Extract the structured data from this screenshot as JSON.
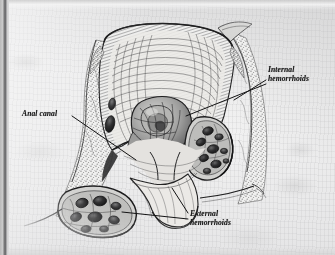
{
  "figure": {
    "kind": "medical-illustration",
    "style": "grayscale engraving / stipple-and-hatch line art on scanned paper",
    "background_color": "#e6e6e7",
    "ink_color": "#1b1b1b",
    "scan_edge_color": "#6f6f70"
  },
  "labels": {
    "internal": {
      "line1": "Internal",
      "line2": "hemorrhoids",
      "name": "internal-hemorrhoids-label"
    },
    "anal_canal": {
      "line1": "Anal canal",
      "name": "anal-canal-label"
    },
    "external": {
      "line1": "External",
      "line2": "hemorrhoids",
      "name": "external-hemorrhoids-label"
    }
  },
  "structures": [
    {
      "name": "rectum-wall",
      "description": "cross-hatched muscular wall of rectum forming the upper chamber"
    },
    {
      "name": "rectal-lumen",
      "description": "open lumen of the rectum above the anal canal"
    },
    {
      "name": "internal-hemorrhoid-mass",
      "description": "central cluster of engorged submucosal veins prolapsing into the canal"
    },
    {
      "name": "internal-hemorrhoid-pouch-right",
      "description": "right-side pouch of dilated vein lumens below the dentate line"
    },
    {
      "name": "anal-canal",
      "description": "narrow canal between the internal and external sphincters"
    },
    {
      "name": "external-hemorrhoid-cluster",
      "description": "lower-left cluster of dilated perianal veins beneath the skin"
    },
    {
      "name": "perianal-fat",
      "description": "stippled fatty connective tissue flanking the canal"
    },
    {
      "name": "anal-verge",
      "description": "outer skin margin of the anus"
    }
  ],
  "leader_lines": [
    {
      "name": "leader-internal-upper",
      "from_label": "internal",
      "to_structure": "internal-hemorrhoid-pouch-right"
    },
    {
      "name": "leader-internal-lower",
      "from_label": "internal",
      "to_structure": "internal-hemorrhoid-mass"
    },
    {
      "name": "leader-anal-canal",
      "from_label": "anal_canal",
      "to_structure": "anal-canal"
    },
    {
      "name": "leader-external-upper",
      "from_label": "external",
      "to_structure": "anal-verge"
    },
    {
      "name": "leader-external-lower",
      "from_label": "external",
      "to_structure": "external-hemorrhoid-cluster"
    }
  ]
}
